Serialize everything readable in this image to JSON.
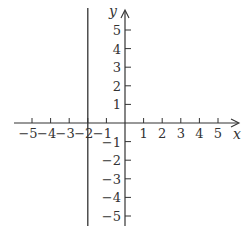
{
  "chart_data": {
    "type": "line",
    "title": "",
    "xlabel": "x",
    "ylabel": "y",
    "xlim": [
      -5,
      5
    ],
    "ylim": [
      -5,
      5
    ],
    "grid": false,
    "x_ticks": [
      -5,
      -4,
      -3,
      -2,
      -1,
      1,
      2,
      3,
      4,
      5
    ],
    "y_ticks": [
      5,
      4,
      3,
      2,
      1,
      -1,
      -2,
      -3,
      -4,
      -5
    ],
    "x_tick_labels": [
      "−5",
      "−4",
      "−3",
      "−2",
      "−1",
      "1",
      "2",
      "3",
      "4",
      "5"
    ],
    "y_tick_labels": [
      "5",
      "4",
      "3",
      "2",
      "1",
      "−1",
      "−2",
      "−3",
      "−4",
      "−5"
    ],
    "series": [
      {
        "name": "x = -2",
        "equation": "x = -2",
        "kind": "vertical-line",
        "x": [
          -2,
          -2
        ],
        "y": [
          -6,
          6
        ]
      }
    ]
  },
  "axes": {
    "x_label": "x",
    "y_label": "y",
    "color": "#333333"
  }
}
